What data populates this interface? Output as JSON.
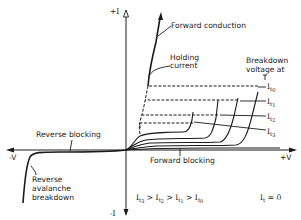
{
  "diagram": {
    "axes": {
      "y_positive": "+I",
      "y_negative": "-I",
      "x_positive": "+V",
      "x_negative": "-V"
    },
    "annotations": {
      "forward_conduction": "Forward conduction",
      "holding_current_line1": "Holding",
      "holding_current_line2": "current",
      "breakdown_line1": "Breakdown",
      "breakdown_line2": "voltage at",
      "reverse_blocking": "Reverse blocking",
      "forward_blocking": "Forward blocking",
      "reverse_avalanche_line1": "Reverse",
      "reverse_avalanche_line2": "avalanche",
      "reverse_avalanche_line3": "breakdown"
    },
    "curve_labels": {
      "it0": "0",
      "it1": "1",
      "it2": "2",
      "it3": "3",
      "prefix": "I",
      "sub_prefix": "t"
    },
    "relation": "It3 > It2 > It1 > It0",
    "relation_parts": [
      "3",
      "2",
      "1",
      "0"
    ],
    "relation_sep": ">",
    "it_zero": {
      "base": "I",
      "sub": "t",
      "eq": "= 0"
    }
  },
  "colors": {
    "ink": "#1a1a1a",
    "background": "#ffffff"
  }
}
